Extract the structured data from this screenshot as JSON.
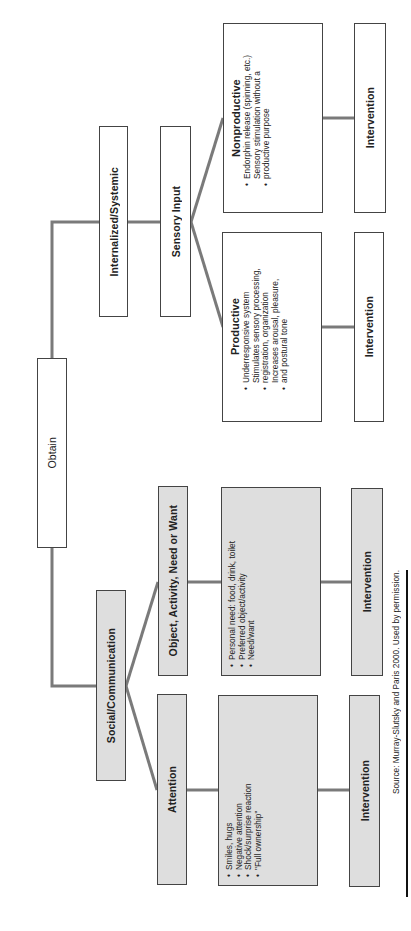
{
  "diagram": {
    "orientation": "rotated 90° counter-clockwise",
    "root": {
      "label": "Obtain"
    },
    "branches": [
      {
        "label": "Internalized/Systemic",
        "child": {
          "label": "Sensory Input",
          "outcomes": [
            {
              "title": "Nonproductive",
              "bullets": [
                "Endorphin release (spinning, etc.)",
                "Sensory stimulation without a productive purpose"
              ],
              "intervention": "Intervention"
            },
            {
              "title": "Productive",
              "bullets": [
                "Underresponsive system",
                "Stimulates sensory processing, registration, organization",
                "Increases arousal, pleasure, and postural tone"
              ],
              "intervention": "Intervention"
            }
          ]
        }
      },
      {
        "label": "Social/Communication",
        "children": [
          {
            "label": "Object, Activity, Need or Want",
            "bullets": [
              "Personal need: food, drink, toilet",
              "Preferred object/activity",
              "Need/want"
            ],
            "intervention": "Intervention"
          },
          {
            "label": "Attention",
            "bullets": [
              "Smiles, hugs",
              "Negative attention",
              "Shock/surprise reaction",
              "\"Full ownership\""
            ],
            "intervention": "Intervention"
          }
        ]
      }
    ],
    "source": "Source: Murray-Slutsky and Paris 2000. Used by permission."
  },
  "colors": {
    "connector": "#7a7a7a",
    "border": "#444444",
    "grey_fill": "#dedede",
    "white_fill": "#ffffff",
    "rule": "#111111"
  }
}
